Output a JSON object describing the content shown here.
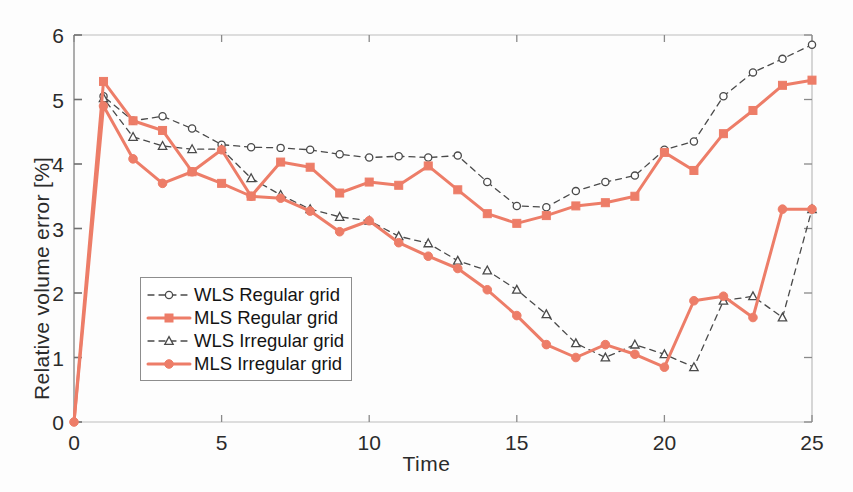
{
  "chart_data": {
    "type": "line",
    "title": "",
    "xlabel": "Time",
    "ylabel": "Relative volume error [%]",
    "xlim": [
      0,
      25
    ],
    "ylim": [
      0,
      6
    ],
    "xticks": [
      0,
      5,
      10,
      15,
      20,
      25
    ],
    "yticks": [
      0,
      1,
      2,
      3,
      4,
      5,
      6
    ],
    "grid": false,
    "legend_position": "center-left",
    "x": [
      0,
      1,
      2,
      3,
      4,
      5,
      6,
      7,
      8,
      9,
      10,
      11,
      12,
      13,
      14,
      15,
      16,
      17,
      18,
      19,
      20,
      21,
      22,
      23,
      24,
      25
    ],
    "series": [
      {
        "name": "WLS Regular grid",
        "color": "#4a4a4a",
        "linestyle": "dashed",
        "marker": "open-circle",
        "values": [
          0.0,
          5.05,
          4.67,
          4.74,
          4.55,
          4.3,
          4.26,
          4.25,
          4.22,
          4.15,
          4.1,
          4.12,
          4.1,
          4.13,
          3.72,
          3.35,
          3.33,
          3.58,
          3.72,
          3.82,
          4.22,
          4.35,
          5.05,
          5.42,
          5.63,
          5.85
        ]
      },
      {
        "name": "MLS Regular grid",
        "color": "#ED7D68",
        "linestyle": "solid",
        "marker": "filled-square",
        "values": [
          0.0,
          5.28,
          4.67,
          4.52,
          3.88,
          3.7,
          3.5,
          4.03,
          3.95,
          3.55,
          3.72,
          3.67,
          3.97,
          3.6,
          3.23,
          3.08,
          3.2,
          3.35,
          3.4,
          3.5,
          4.18,
          3.9,
          4.47,
          4.83,
          5.22,
          5.3
        ]
      },
      {
        "name": "WLS Irregular grid",
        "color": "#4a4a4a",
        "linestyle": "dashed",
        "marker": "open-triangle",
        "values": [
          0.0,
          5.02,
          4.42,
          4.28,
          4.23,
          4.23,
          3.78,
          3.52,
          3.3,
          3.18,
          3.12,
          2.88,
          2.77,
          2.5,
          2.35,
          2.05,
          1.67,
          1.22,
          1.0,
          1.2,
          1.05,
          0.85,
          1.88,
          1.95,
          1.62,
          3.3
        ]
      },
      {
        "name": "MLS Irregular grid",
        "color": "#ED7D68",
        "linestyle": "solid",
        "marker": "filled-circle",
        "values": [
          0.0,
          4.9,
          4.08,
          3.7,
          3.88,
          4.22,
          3.5,
          3.47,
          3.27,
          2.95,
          3.12,
          2.78,
          2.57,
          2.38,
          2.05,
          1.65,
          1.2,
          1.0,
          1.2,
          1.05,
          0.85,
          1.88,
          1.95,
          1.62,
          3.3,
          3.3
        ]
      }
    ],
    "note_overlap": "WLS Irregular and MLS Irregular coincide closely after t=14"
  },
  "legend": {
    "items": [
      {
        "label": "WLS Regular grid"
      },
      {
        "label": "MLS Regular grid"
      },
      {
        "label": "WLS Irregular grid"
      },
      {
        "label": "MLS Irregular grid"
      }
    ]
  },
  "axis": {
    "x_title": "Time",
    "y_title": "Relative volume error [%]"
  }
}
